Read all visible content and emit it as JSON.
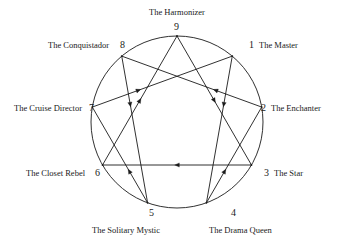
{
  "diagram": {
    "type": "enneagram",
    "geometry": {
      "center_x": 177,
      "center_y": 122,
      "radius": 86,
      "stroke_color": "#1a1a1a",
      "background_color": "#ffffff"
    },
    "points": [
      {
        "number": "9",
        "name": "The Harmonizer",
        "angle_deg": 270,
        "label_x": 149,
        "label_y": 8,
        "number_x": 174,
        "number_y": 22,
        "label_align": "left"
      },
      {
        "number": "1",
        "name": "The Master",
        "angle_deg": 310,
        "label_x": 259,
        "label_y": 41,
        "number_x": 249,
        "number_y": 40,
        "label_align": "left"
      },
      {
        "number": "2",
        "name": "The Enchanter",
        "angle_deg": 350,
        "label_x": 271,
        "label_y": 104,
        "number_x": 261,
        "number_y": 103,
        "label_align": "left"
      },
      {
        "number": "3",
        "name": "The Star",
        "angle_deg": 30,
        "label_x": 274,
        "label_y": 169,
        "number_x": 264,
        "number_y": 168,
        "label_align": "left"
      },
      {
        "number": "4",
        "name": "The Drama Queen",
        "angle_deg": 70,
        "label_x": 209,
        "label_y": 226,
        "number_x": 231,
        "number_y": 208,
        "label_align": "left"
      },
      {
        "number": "5",
        "name": "The Solitary Mystic",
        "angle_deg": 110,
        "label_x": 92,
        "label_y": 226,
        "number_x": 149,
        "number_y": 208,
        "label_align": "left"
      },
      {
        "number": "6",
        "name": "The Closet Rebel",
        "angle_deg": 150,
        "label_x": 26,
        "label_y": 169,
        "number_x": 95,
        "number_y": 168,
        "label_align": "left"
      },
      {
        "number": "7",
        "name": "The Cruise Director",
        "angle_deg": 190,
        "label_x": 14,
        "label_y": 104,
        "number_x": 89,
        "number_y": 103,
        "label_align": "left"
      },
      {
        "number": "8",
        "name": "The Conquistador",
        "angle_deg": 230,
        "label_x": 48,
        "label_y": 41,
        "number_x": 120,
        "number_y": 40,
        "label_align": "left"
      }
    ],
    "triangle": {
      "name": "inner-triangle-9-3-6",
      "sequence": [
        "9",
        "3",
        "6"
      ],
      "closed": true
    },
    "hexad": {
      "name": "inner-hexad-1-4-2-8-5-7",
      "sequence": [
        "1",
        "4",
        "2",
        "8",
        "5",
        "7"
      ],
      "closed": true
    },
    "arrow_marker": "filled-triangle"
  }
}
